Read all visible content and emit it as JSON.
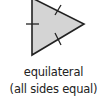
{
  "diagram": {
    "shape": "triangle",
    "type": "equilateral",
    "fill_color": "#d4d4d4",
    "stroke_color": "#222222",
    "tick_marks": 3
  },
  "caption": {
    "title": "equilateral",
    "subtitle": "(all sides equal)"
  }
}
